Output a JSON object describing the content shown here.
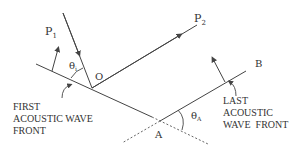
{
  "diagram": {
    "labels": {
      "p1": "P",
      "p1_sub": "1",
      "p2": "P",
      "p2_sub": "2",
      "o": "O",
      "a": "A",
      "b": "B",
      "theta_i": "θ",
      "theta_i_sub": "i",
      "theta_a": "θ",
      "theta_a_sub": "A"
    },
    "first_wavefront": [
      "FIRST",
      "ACOUSTIC WAVE",
      "FRONT"
    ],
    "last_wavefront": [
      "LAST",
      "ACOUSTIC",
      "WAVE  FRONT"
    ],
    "colors": {
      "line": "#444444",
      "text": "#333333",
      "background": "#ffffff"
    }
  }
}
